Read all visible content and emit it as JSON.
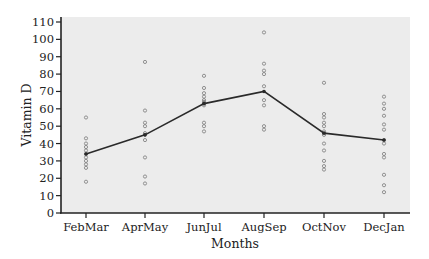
{
  "chart_data": {
    "type": "scatter",
    "title": "",
    "xlabel": "Months",
    "ylabel": "Vitamin D",
    "ylim": [
      0,
      110
    ],
    "yticks": [
      0,
      10,
      20,
      30,
      40,
      50,
      60,
      70,
      80,
      90,
      100,
      110
    ],
    "grid": false,
    "legend": null,
    "categories": [
      "FebMar",
      "AprMay",
      "JunJul",
      "AugSep",
      "OctNov",
      "DecJan"
    ],
    "series": [
      {
        "name": "observations",
        "type": "scatter",
        "marker": "open-circle",
        "points": [
          [
            55,
            43,
            40,
            38,
            36,
            34,
            32,
            30,
            28,
            26,
            18
          ],
          [
            87,
            59,
            52,
            50,
            46,
            45,
            42,
            32,
            21,
            17
          ],
          [
            79,
            72,
            69,
            67,
            65,
            64,
            63,
            62,
            52,
            50,
            47
          ],
          [
            104,
            86,
            82,
            80,
            73,
            65,
            62,
            50,
            48
          ],
          [
            75,
            57,
            55,
            52,
            50,
            47,
            45,
            40,
            36,
            30,
            27,
            25
          ],
          [
            67,
            63,
            60,
            56,
            51,
            48,
            42,
            40,
            34,
            32,
            22,
            16,
            12
          ]
        ]
      },
      {
        "name": "mean",
        "type": "line",
        "values": [
          34,
          45,
          63,
          70,
          46,
          42
        ]
      }
    ]
  },
  "colors": {
    "plot_background": "#ececec",
    "axis": "#222222",
    "line": "#2a2a2a",
    "marker": "#7a7a7a"
  }
}
